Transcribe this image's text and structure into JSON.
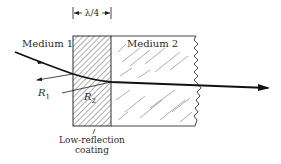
{
  "figure": {
    "dimension_label": "λ/4",
    "medium1_label": "Medium 1",
    "medium2_label": "Medium 2",
    "r1_label": "R",
    "r1_sub": "1",
    "r2_label": "R",
    "r2_sub": "2",
    "coating_label_line1": "Low-reflection",
    "coating_label_line2": "coating"
  },
  "colors": {
    "ink": "#1a1a1a",
    "background": "#ffffff"
  }
}
